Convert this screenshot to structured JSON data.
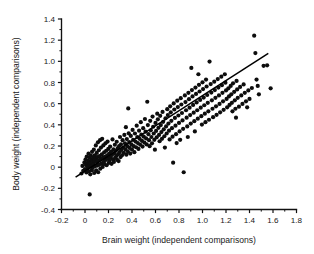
{
  "chart_data": {
    "type": "scatter",
    "title": "",
    "xlabel": "Brain weight (independent comparisons)",
    "ylabel": "Body weight (independent comparisons)",
    "xlim": [
      -0.2,
      1.8
    ],
    "ylim": [
      -0.4,
      1.4
    ],
    "xticks": [
      -0.2,
      0,
      0.2,
      0.4,
      0.6,
      0.8,
      1.0,
      1.2,
      1.4,
      1.6,
      1.8
    ],
    "yticks": [
      -0.4,
      -0.2,
      0,
      0.2,
      0.4,
      0.6,
      0.8,
      1.0,
      1.2,
      1.4
    ],
    "xticklabels": [
      "-0.2",
      "0",
      "0.2",
      "0.4",
      "0.6",
      "0.8",
      "1.0",
      "1.2",
      "1.4",
      "1.6",
      "1.8"
    ],
    "yticklabels": [
      "-0.4",
      "-0.2",
      "0",
      "0.2",
      "0.4",
      "0.6",
      "0.8",
      "1.0",
      "1.2",
      "1.4"
    ],
    "minor_ticks_per_interval": 1,
    "grid": false,
    "legend": null,
    "marker": "filled-circle",
    "marker_color": "#0d0d0d",
    "marker_size_px": 2.1,
    "fit_line": {
      "label": "regression line",
      "color": "#000000",
      "x_start": -0.08,
      "y_start": -0.095,
      "x_end": 1.56,
      "y_end": 1.075,
      "slope": 0.7134,
      "intercept": -0.0379
    },
    "points": [
      [
        0.04,
        -0.258
      ],
      [
        -0.03,
        -0.06
      ],
      [
        -0.022,
        0.012
      ],
      [
        -0.015,
        -0.035
      ],
      [
        -0.005,
        0.045
      ],
      [
        0.0,
        -0.018
      ],
      [
        0.005,
        0.075
      ],
      [
        0.008,
        0.02
      ],
      [
        0.012,
        -0.05
      ],
      [
        0.015,
        0.1
      ],
      [
        0.018,
        0.038
      ],
      [
        0.022,
        -0.012
      ],
      [
        0.025,
        0.062
      ],
      [
        0.028,
        0.008
      ],
      [
        0.03,
        0.128
      ],
      [
        0.033,
        -0.04
      ],
      [
        0.036,
        0.052
      ],
      [
        0.04,
        0.092
      ],
      [
        0.042,
        0.018
      ],
      [
        0.045,
        -0.068
      ],
      [
        0.048,
        0.035
      ],
      [
        0.05,
        0.11
      ],
      [
        0.053,
        0.002
      ],
      [
        0.056,
        0.07
      ],
      [
        0.058,
        -0.028
      ],
      [
        0.06,
        0.145
      ],
      [
        0.063,
        0.042
      ],
      [
        0.066,
        -0.005
      ],
      [
        0.07,
        0.088
      ],
      [
        0.072,
        0.025
      ],
      [
        0.075,
        0.165
      ],
      [
        0.078,
        -0.055
      ],
      [
        0.08,
        0.058
      ],
      [
        0.083,
        0.112
      ],
      [
        0.086,
        0.01
      ],
      [
        0.09,
        0.08
      ],
      [
        0.092,
        0.205
      ],
      [
        0.095,
        -0.03
      ],
      [
        0.098,
        0.048
      ],
      [
        0.1,
        0.135
      ],
      [
        0.103,
        0.015
      ],
      [
        0.106,
        0.095
      ],
      [
        0.11,
        0.235
      ],
      [
        0.112,
        -0.048
      ],
      [
        0.115,
        0.065
      ],
      [
        0.118,
        0.16
      ],
      [
        0.12,
        0.022
      ],
      [
        0.124,
        0.105
      ],
      [
        0.128,
        0.255
      ],
      [
        0.13,
        -0.015
      ],
      [
        0.133,
        0.078
      ],
      [
        0.136,
        0.185
      ],
      [
        0.14,
        0.035
      ],
      [
        0.143,
        0.12
      ],
      [
        0.146,
        0.268
      ],
      [
        0.15,
        0.002
      ],
      [
        0.153,
        0.09
      ],
      [
        0.156,
        0.205
      ],
      [
        0.16,
        0.05
      ],
      [
        0.163,
        0.14
      ],
      [
        0.166,
        0.03
      ],
      [
        0.17,
        0.098
      ],
      [
        0.174,
        0.225
      ],
      [
        0.177,
        0.068
      ],
      [
        0.18,
        0.155
      ],
      [
        0.184,
        0.018
      ],
      [
        0.188,
        0.112
      ],
      [
        0.192,
        0.242
      ],
      [
        0.195,
        0.08
      ],
      [
        0.198,
        0.172
      ],
      [
        0.202,
        0.04
      ],
      [
        0.206,
        0.128
      ],
      [
        0.21,
        0.06
      ],
      [
        0.214,
        0.195
      ],
      [
        0.218,
        0.092
      ],
      [
        0.222,
        0.148
      ],
      [
        0.226,
        0.032
      ],
      [
        0.23,
        0.115
      ],
      [
        0.234,
        0.262
      ],
      [
        0.238,
        0.075
      ],
      [
        0.242,
        0.168
      ],
      [
        0.246,
        0.05
      ],
      [
        0.25,
        0.132
      ],
      [
        0.254,
        0.212
      ],
      [
        0.258,
        0.088
      ],
      [
        0.262,
        0.155
      ],
      [
        0.266,
        0.105
      ],
      [
        0.27,
        0.24
      ],
      [
        0.274,
        0.068
      ],
      [
        0.278,
        0.178
      ],
      [
        0.282,
        0.122
      ],
      [
        0.286,
        0.058
      ],
      [
        0.29,
        0.198
      ],
      [
        0.294,
        0.142
      ],
      [
        0.298,
        0.285
      ],
      [
        0.302,
        0.095
      ],
      [
        0.306,
        0.215
      ],
      [
        0.31,
        0.162
      ],
      [
        0.315,
        0.112
      ],
      [
        0.32,
        0.255
      ],
      [
        0.325,
        0.185
      ],
      [
        0.33,
        0.135
      ],
      [
        0.335,
        0.305
      ],
      [
        0.34,
        0.225
      ],
      [
        0.345,
        0.168
      ],
      [
        0.348,
        0.378
      ],
      [
        0.352,
        0.118
      ],
      [
        0.356,
        0.265
      ],
      [
        0.36,
        0.198
      ],
      [
        0.365,
        0.148
      ],
      [
        0.368,
        0.555
      ],
      [
        0.372,
        0.32
      ],
      [
        0.376,
        0.238
      ],
      [
        0.38,
        0.182
      ],
      [
        0.385,
        0.128
      ],
      [
        0.39,
        0.295
      ],
      [
        0.395,
        0.215
      ],
      [
        0.4,
        0.165
      ],
      [
        0.405,
        0.352
      ],
      [
        0.41,
        0.258
      ],
      [
        0.415,
        0.198
      ],
      [
        0.42,
        0.142
      ],
      [
        0.425,
        0.318
      ],
      [
        0.43,
        0.242
      ],
      [
        0.435,
        0.188
      ],
      [
        0.44,
        0.392
      ],
      [
        0.445,
        0.285
      ],
      [
        0.45,
        0.228
      ],
      [
        0.455,
        0.172
      ],
      [
        0.46,
        0.345
      ],
      [
        0.465,
        0.268
      ],
      [
        0.47,
        0.212
      ],
      [
        0.475,
        0.425
      ],
      [
        0.48,
        0.308
      ],
      [
        0.485,
        0.248
      ],
      [
        0.49,
        0.195
      ],
      [
        0.495,
        0.368
      ],
      [
        0.5,
        0.288
      ],
      [
        0.505,
        0.232
      ],
      [
        0.51,
        0.455
      ],
      [
        0.515,
        0.335
      ],
      [
        0.52,
        0.272
      ],
      [
        0.525,
        0.215
      ],
      [
        0.53,
        0.618
      ],
      [
        0.535,
        0.398
      ],
      [
        0.54,
        0.312
      ],
      [
        0.545,
        0.255
      ],
      [
        0.55,
        0.198
      ],
      [
        0.555,
        0.438
      ],
      [
        0.56,
        0.348
      ],
      [
        0.565,
        0.285
      ],
      [
        0.57,
        0.225
      ],
      [
        0.575,
        0.478
      ],
      [
        0.58,
        0.382
      ],
      [
        0.585,
        0.318
      ],
      [
        0.59,
        0.258
      ],
      [
        0.595,
        0.165
      ],
      [
        0.6,
        0.418
      ],
      [
        0.605,
        0.342
      ],
      [
        0.61,
        0.282
      ],
      [
        0.615,
        0.505
      ],
      [
        0.62,
        0.452
      ],
      [
        0.625,
        0.372
      ],
      [
        0.63,
        0.305
      ],
      [
        0.635,
        0.245
      ],
      [
        0.64,
        0.485
      ],
      [
        0.645,
        0.398
      ],
      [
        0.65,
        0.332
      ],
      [
        0.655,
        0.268
      ],
      [
        0.66,
        0.522
      ],
      [
        0.665,
        0.428
      ],
      [
        0.67,
        0.358
      ],
      [
        0.675,
        0.292
      ],
      [
        0.68,
        0.185
      ],
      [
        0.685,
        0.462
      ],
      [
        0.69,
        0.385
      ],
      [
        0.695,
        0.318
      ],
      [
        0.7,
        0.548
      ],
      [
        0.705,
        0.492
      ],
      [
        0.71,
        0.412
      ],
      [
        0.715,
        0.345
      ],
      [
        0.72,
        0.262
      ],
      [
        0.725,
        0.575
      ],
      [
        0.73,
        0.518
      ],
      [
        0.735,
        0.438
      ],
      [
        0.74,
        0.368
      ],
      [
        0.745,
        0.288
      ],
      [
        0.75,
        0.042
      ],
      [
        0.755,
        0.602
      ],
      [
        0.76,
        0.545
      ],
      [
        0.765,
        0.465
      ],
      [
        0.77,
        0.392
      ],
      [
        0.775,
        0.312
      ],
      [
        0.78,
        0.228
      ],
      [
        0.785,
        0.628
      ],
      [
        0.79,
        0.568
      ],
      [
        0.795,
        0.488
      ],
      [
        0.8,
        0.418
      ],
      [
        0.805,
        0.338
      ],
      [
        0.81,
        0.258
      ],
      [
        0.815,
        0.652
      ],
      [
        0.82,
        0.592
      ],
      [
        0.825,
        0.512
      ],
      [
        0.83,
        0.442
      ],
      [
        0.835,
        0.362
      ],
      [
        0.84,
        -0.048
      ],
      [
        0.85,
        0.678
      ],
      [
        0.855,
        0.615
      ],
      [
        0.86,
        0.538
      ],
      [
        0.865,
        0.468
      ],
      [
        0.87,
        0.385
      ],
      [
        0.875,
        0.285
      ],
      [
        0.88,
        0.702
      ],
      [
        0.885,
        0.642
      ],
      [
        0.89,
        0.562
      ],
      [
        0.895,
        0.492
      ],
      [
        0.9,
        0.412
      ],
      [
        0.905,
        0.938
      ],
      [
        0.91,
        0.728
      ],
      [
        0.915,
        0.668
      ],
      [
        0.92,
        0.588
      ],
      [
        0.925,
        0.515
      ],
      [
        0.93,
        0.435
      ],
      [
        0.935,
        0.338
      ],
      [
        0.94,
        0.752
      ],
      [
        0.945,
        0.692
      ],
      [
        0.95,
        0.612
      ],
      [
        0.955,
        0.538
      ],
      [
        0.96,
        0.458
      ],
      [
        0.965,
        0.878
      ],
      [
        0.97,
        0.778
      ],
      [
        0.975,
        0.715
      ],
      [
        0.98,
        0.635
      ],
      [
        0.985,
        0.562
      ],
      [
        0.99,
        0.482
      ],
      [
        0.995,
        0.402
      ],
      [
        1.0,
        0.802
      ],
      [
        1.005,
        0.738
      ],
      [
        1.01,
        0.658
      ],
      [
        1.015,
        0.585
      ],
      [
        1.02,
        0.505
      ],
      [
        1.025,
        0.425
      ],
      [
        1.03,
        0.828
      ],
      [
        1.035,
        0.762
      ],
      [
        1.04,
        0.682
      ],
      [
        1.045,
        0.608
      ],
      [
        1.05,
        0.528
      ],
      [
        1.055,
        0.448
      ],
      [
        1.06,
        0.998
      ],
      [
        1.07,
        0.785
      ],
      [
        1.075,
        0.705
      ],
      [
        1.08,
        0.632
      ],
      [
        1.085,
        0.552
      ],
      [
        1.09,
        0.472
      ],
      [
        1.1,
        0.808
      ],
      [
        1.105,
        0.728
      ],
      [
        1.11,
        0.655
      ],
      [
        1.115,
        0.575
      ],
      [
        1.12,
        0.495
      ],
      [
        1.13,
        0.832
      ],
      [
        1.135,
        0.752
      ],
      [
        1.14,
        0.678
      ],
      [
        1.145,
        0.598
      ],
      [
        1.15,
        0.518
      ],
      [
        1.16,
        0.855
      ],
      [
        1.165,
        0.775
      ],
      [
        1.17,
        0.702
      ],
      [
        1.175,
        0.622
      ],
      [
        1.18,
        0.542
      ],
      [
        1.19,
        0.878
      ],
      [
        1.195,
        0.798
      ],
      [
        1.2,
        0.725
      ],
      [
        1.205,
        0.645
      ],
      [
        1.21,
        0.565
      ],
      [
        1.22,
        0.745
      ],
      [
        1.225,
        0.668
      ],
      [
        1.23,
        0.588
      ],
      [
        1.24,
        0.768
      ],
      [
        1.245,
        0.688
      ],
      [
        1.25,
        0.608
      ],
      [
        1.255,
        0.528
      ],
      [
        1.26,
        0.792
      ],
      [
        1.27,
        0.712
      ],
      [
        1.275,
        0.632
      ],
      [
        1.28,
        0.552
      ],
      [
        1.285,
        0.468
      ],
      [
        1.29,
        0.815
      ],
      [
        1.295,
        0.735
      ],
      [
        1.3,
        0.655
      ],
      [
        1.31,
        0.572
      ],
      [
        1.32,
        0.758
      ],
      [
        1.33,
        0.678
      ],
      [
        1.34,
        0.598
      ],
      [
        1.35,
        0.782
      ],
      [
        1.36,
        0.702
      ],
      [
        1.37,
        0.622
      ],
      [
        1.38,
        0.565
      ],
      [
        1.39,
        0.725
      ],
      [
        1.4,
        0.645
      ],
      [
        1.42,
        0.748
      ],
      [
        1.44,
        1.242
      ],
      [
        1.45,
        1.078
      ],
      [
        1.46,
        0.828
      ],
      [
        1.47,
        0.768
      ],
      [
        1.48,
        0.688
      ],
      [
        1.52,
        0.958
      ],
      [
        1.55,
        0.962
      ],
      [
        1.58,
        0.745
      ]
    ]
  }
}
